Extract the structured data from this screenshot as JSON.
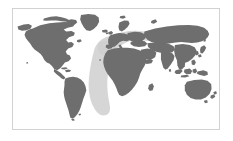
{
  "figure": {
    "kind": "world-map",
    "title": "",
    "caption": "",
    "projection": "equirectangular",
    "has_axes": false,
    "has_legend": false,
    "has_labels": false,
    "background_color": "#ffffff",
    "ocean_color": "#ffffff",
    "land_color": "#6e6e6e",
    "halo_color": "#cfcfcf",
    "frame": {
      "border_color": "#d2d2d2",
      "border_width_px": 1,
      "x_px": 12,
      "y_px": 8,
      "width_px": 208,
      "height_px": 122
    },
    "extent": {
      "lon_min": -180,
      "lon_max": 180,
      "lat_min": -58,
      "lat_max": 84
    },
    "highlight": {
      "label": "africa-mediterranean-halo",
      "center_lon": 16,
      "center_lat": 6,
      "color": "#cfcfcf"
    },
    "regions": [
      {
        "name": "north-america"
      },
      {
        "name": "greenland"
      },
      {
        "name": "south-america"
      },
      {
        "name": "europe"
      },
      {
        "name": "africa"
      },
      {
        "name": "asia"
      },
      {
        "name": "australia"
      },
      {
        "name": "new-zealand"
      },
      {
        "name": "japan"
      },
      {
        "name": "indonesia"
      },
      {
        "name": "madagascar"
      },
      {
        "name": "british-isles"
      }
    ]
  }
}
